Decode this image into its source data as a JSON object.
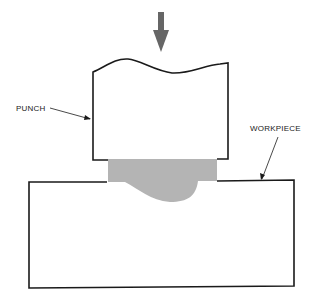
{
  "diagram": {
    "labels": {
      "punch": "PUNCH",
      "workpiece": "WORKPIECE"
    },
    "colors": {
      "stroke": "#1a1a1a",
      "arrow": "#666666",
      "deformed_zone": "#b4b4b4"
    },
    "icons": {
      "force_arrow": "down-arrow"
    }
  }
}
